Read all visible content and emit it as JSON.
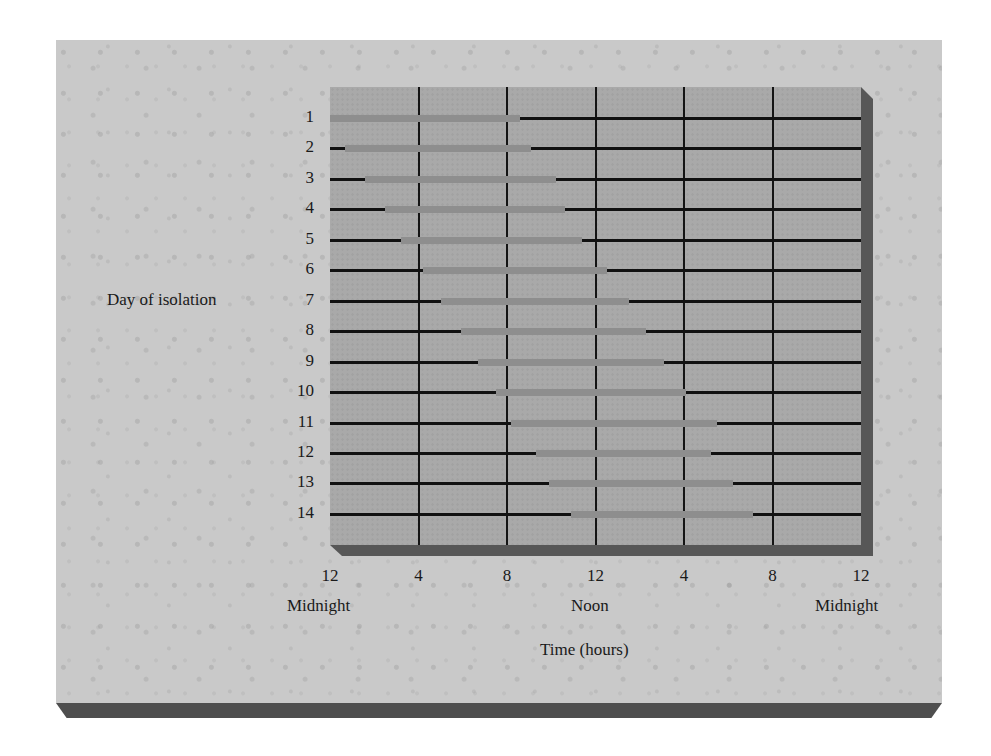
{
  "chart_data": {
    "type": "bar",
    "subtype": "horizontal-timeline",
    "title": "",
    "xlabel": "Time (hours)",
    "ylabel": "Day of isolation",
    "xlim": [
      0,
      24
    ],
    "x_ticks": [
      {
        "hour": 0,
        "label": "12",
        "sub": "Midnight"
      },
      {
        "hour": 4,
        "label": "4",
        "sub": ""
      },
      {
        "hour": 8,
        "label": "8",
        "sub": ""
      },
      {
        "hour": 12,
        "label": "12",
        "sub": "Noon"
      },
      {
        "hour": 16,
        "label": "4",
        "sub": ""
      },
      {
        "hour": 20,
        "label": "8",
        "sub": ""
      },
      {
        "hour": 24,
        "label": "12",
        "sub": "Midnight"
      }
    ],
    "grid": {
      "vertical": true,
      "horizontal": false
    },
    "legend": null,
    "series": [
      {
        "name": "Rest period (gray bar)",
        "color": "#8e8e8e"
      },
      {
        "name": "Active period (black line)",
        "color": "#111111"
      }
    ],
    "categories": [
      "1",
      "2",
      "3",
      "4",
      "5",
      "6",
      "7",
      "8",
      "9",
      "10",
      "11",
      "12",
      "13",
      "14"
    ],
    "rows": [
      {
        "day": 1,
        "rest_start": 0.0,
        "rest_end": 8.6
      },
      {
        "day": 2,
        "rest_start": 0.7,
        "rest_end": 9.1
      },
      {
        "day": 3,
        "rest_start": 1.6,
        "rest_end": 10.2
      },
      {
        "day": 4,
        "rest_start": 2.5,
        "rest_end": 10.6
      },
      {
        "day": 5,
        "rest_start": 3.2,
        "rest_end": 11.4
      },
      {
        "day": 6,
        "rest_start": 4.2,
        "rest_end": 12.5
      },
      {
        "day": 7,
        "rest_start": 5.0,
        "rest_end": 13.5
      },
      {
        "day": 8,
        "rest_start": 5.9,
        "rest_end": 14.3
      },
      {
        "day": 9,
        "rest_start": 6.7,
        "rest_end": 15.1
      },
      {
        "day": 10,
        "rest_start": 7.5,
        "rest_end": 16.1
      },
      {
        "day": 11,
        "rest_start": 8.2,
        "rest_end": 17.5
      },
      {
        "day": 12,
        "rest_start": 9.3,
        "rest_end": 17.2
      },
      {
        "day": 13,
        "rest_start": 9.9,
        "rest_end": 18.2
      },
      {
        "day": 14,
        "rest_start": 10.9,
        "rest_end": 19.1
      }
    ]
  },
  "labels": {
    "ylabel": "Day of isolation",
    "xlabel": "Time (hours)",
    "midnight_left": "Midnight",
    "noon": "Noon",
    "midnight_right": "Midnight"
  },
  "colors": {
    "panel": "#c9c9c9",
    "plot": "#a9a9a9",
    "rest": "#8e8e8e",
    "active": "#111111",
    "shadow": "#575757"
  }
}
